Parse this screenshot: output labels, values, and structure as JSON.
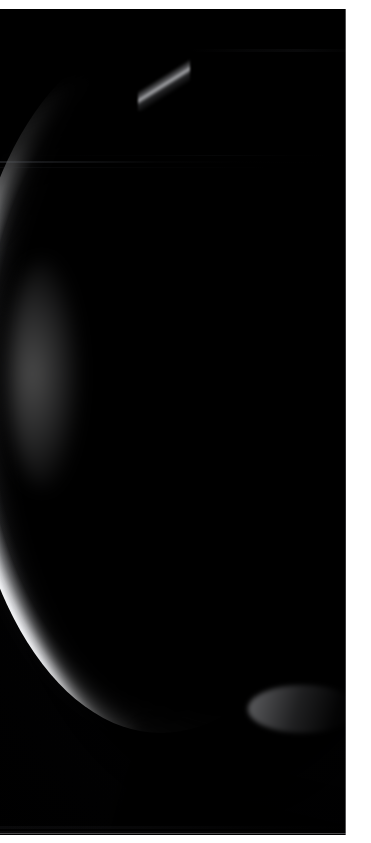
{
  "image": {
    "subject": "crescent-planet",
    "title": "Crescent limb of a planetary body",
    "description": "A thin sunlit crescent arcs from the upper centre of the frame, bulges out toward the left edge, then sweeps down and exits through the lower right of the black sky field.",
    "medium": "astronomical photograph",
    "orientation": "portrait",
    "width_px": 371,
    "height_px": 843
  },
  "frame": {
    "page_background": "#ffffff",
    "plate_background": "#000000",
    "margin_top_px": 9,
    "margin_right_px": 25,
    "margin_bottom_px": 8,
    "plate_width_px": 346,
    "plate_height_px": 826,
    "edge_hairline_color": "#9a9a9c"
  },
  "colors": {
    "sky": "#000000",
    "limb_peak": "#f3f4f6",
    "limb_mid": "#cdced1",
    "limb_falloff": "#8c8d90",
    "terminator_shadow": "#050506",
    "band_artifact": "#5c6068",
    "page": "#ffffff"
  },
  "crescent": {
    "name": "sunlit-limb",
    "upper_cusp_x": 168,
    "upper_cusp_y": 55,
    "widest_point_x": 30,
    "widest_point_y": 360,
    "outer_limb_leftmost_x": 14,
    "lower_cusp_exit_x": 346,
    "lower_cusp_exit_y": 716,
    "max_thickness_px": 26,
    "peak_brightness": "#f3f4f6",
    "illumination_direction": "left",
    "shape": "thin-crescent"
  },
  "artifacts": {
    "scanline_bands": [
      {
        "name": "band-upper-primary",
        "y": 152,
        "height": 2,
        "intensity": "0.30"
      },
      {
        "name": "band-upper-secondary",
        "y": 158,
        "height": 1,
        "intensity": "0.16"
      },
      {
        "name": "band-upper-faint",
        "y": 146,
        "height": 1,
        "intensity": "0.14"
      },
      {
        "name": "band-top-right",
        "y": 40,
        "height": 3,
        "intensity": "0.26"
      },
      {
        "name": "band-lower-primary",
        "y": 817,
        "height": 3,
        "intensity": "0.30"
      },
      {
        "name": "band-lower-secondary",
        "y": 822,
        "height": 2,
        "intensity": "0.22"
      }
    ]
  }
}
